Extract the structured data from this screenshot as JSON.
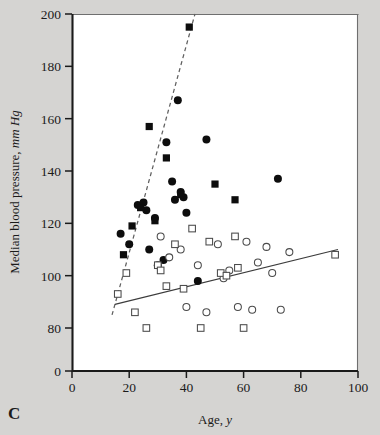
{
  "panel": {
    "label": "C"
  },
  "chart_data": {
    "type": "scatter",
    "title": "",
    "xlabel_main": "Age,",
    "xlabel_italic": "y",
    "ylabel_main": "Median blood pressure,",
    "ylabel_italic": "mm Hg",
    "xlim": [
      0,
      100
    ],
    "ylim": [
      0,
      200
    ],
    "y_axis_break": true,
    "y_break_from": 0,
    "y_break_to": 80,
    "grid": false,
    "legend_position": "none",
    "xticks": [
      0,
      20,
      40,
      60,
      80,
      100
    ],
    "xticklabels": [
      "0",
      "20",
      "40",
      "60",
      "80",
      "100"
    ],
    "yticks": [
      0,
      80,
      100,
      120,
      140,
      160,
      180,
      200
    ],
    "yticklabels": [
      "0",
      "80",
      "100",
      "120",
      "140",
      "160",
      "180",
      "200"
    ],
    "series": [
      {
        "name": "filled-circle",
        "marker": "filled-circle",
        "color": "#0d0d0d",
        "points": [
          [
            17,
            116
          ],
          [
            20,
            112
          ],
          [
            23,
            127
          ],
          [
            25,
            128
          ],
          [
            26,
            125
          ],
          [
            27,
            110
          ],
          [
            29,
            122
          ],
          [
            30,
            104
          ],
          [
            32,
            106
          ],
          [
            33,
            151
          ],
          [
            35,
            136
          ],
          [
            36,
            129
          ],
          [
            37,
            167
          ],
          [
            38,
            132
          ],
          [
            39,
            130
          ],
          [
            40,
            124
          ],
          [
            44,
            98
          ],
          [
            47,
            152
          ],
          [
            72,
            137
          ]
        ]
      },
      {
        "name": "filled-square",
        "marker": "filled-square",
        "color": "#0d0d0d",
        "points": [
          [
            18,
            108
          ],
          [
            21,
            119
          ],
          [
            24,
            126
          ],
          [
            27,
            157
          ],
          [
            29,
            121
          ],
          [
            33,
            145
          ],
          [
            38,
            131
          ],
          [
            41,
            195
          ],
          [
            50,
            135
          ],
          [
            57,
            129
          ]
        ]
      },
      {
        "name": "open-circle",
        "marker": "open-circle",
        "color": "#ffffff",
        "points": [
          [
            31,
            115
          ],
          [
            34,
            107
          ],
          [
            38,
            110
          ],
          [
            40,
            88
          ],
          [
            44,
            104
          ],
          [
            47,
            86
          ],
          [
            51,
            112
          ],
          [
            53,
            99
          ],
          [
            55,
            102
          ],
          [
            58,
            88
          ],
          [
            61,
            113
          ],
          [
            63,
            87
          ],
          [
            65,
            105
          ],
          [
            68,
            111
          ],
          [
            70,
            101
          ],
          [
            73,
            87
          ],
          [
            76,
            109
          ]
        ]
      },
      {
        "name": "open-square",
        "marker": "open-square",
        "color": "#ffffff",
        "points": [
          [
            16,
            93
          ],
          [
            19,
            101
          ],
          [
            22,
            86
          ],
          [
            26,
            80
          ],
          [
            30,
            104
          ],
          [
            31,
            102
          ],
          [
            33,
            96
          ],
          [
            36,
            112
          ],
          [
            39,
            95
          ],
          [
            42,
            118
          ],
          [
            45,
            80
          ],
          [
            48,
            113
          ],
          [
            52,
            101
          ],
          [
            54,
            100
          ],
          [
            57,
            115
          ],
          [
            58,
            103
          ],
          [
            60,
            80
          ],
          [
            92,
            108
          ]
        ]
      }
    ],
    "fit_lines": [
      {
        "name": "dashed-fit",
        "style": "dashed",
        "color": "#606060",
        "x0": 14,
        "y0": 85,
        "x1": 43,
        "y1": 200
      },
      {
        "name": "solid-fit",
        "style": "solid",
        "color": "#3c3c3c",
        "x0": 15,
        "y0": 89,
        "x1": 93,
        "y1": 110
      }
    ]
  }
}
